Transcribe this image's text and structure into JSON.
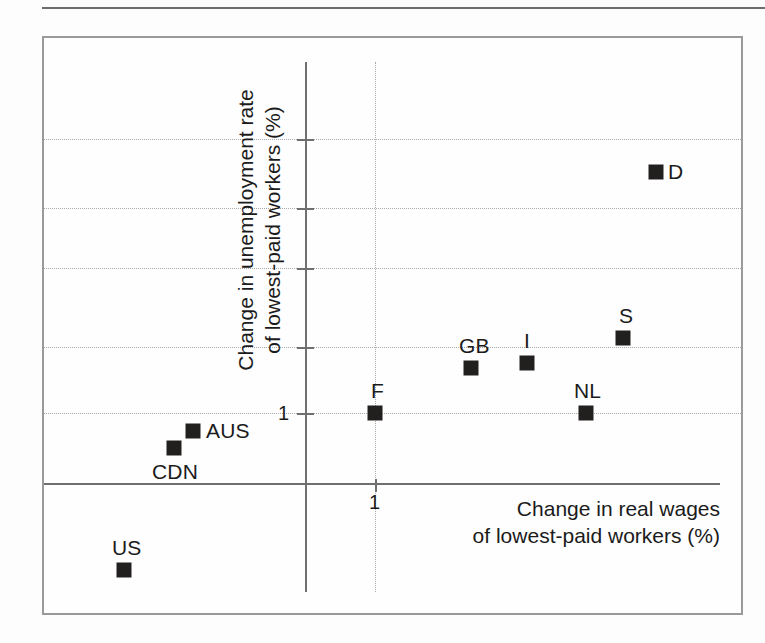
{
  "figure": {
    "background_color": "#fdfdfd",
    "frame_color": "#9a9a9a",
    "axis_color": "#6f6f6f",
    "grid_color": "#a9a9a9",
    "marker_color": "#221f1f",
    "text_color": "#1b1b1b"
  },
  "chart_data": {
    "type": "scatter",
    "title": "",
    "xlabel": "Change in real wages\nof lowest-paid workers (%)",
    "ylabel": "Change in unemployment rate\nof lowest-paid workers (%)",
    "grid": true,
    "legend": "none",
    "xtick_labels": [
      "1"
    ],
    "ytick_labels": [
      "1"
    ],
    "x_axis_note": "origin axes cross; only the value 1 is labelled on each axis",
    "y_axis_note": "five horizontal dotted gridlines, the lowest one labelled 1",
    "points": [
      {
        "label": "D",
        "x_px": 656,
        "y_px": 172,
        "label_dx": 12,
        "label_dy": -12,
        "label_align": "right-of-marker"
      },
      {
        "label": "S",
        "x_px": 623,
        "y_px": 338,
        "label_dx": -4,
        "label_dy": -34,
        "label_align": "above-marker"
      },
      {
        "label": "I",
        "x_px": 527,
        "y_px": 363,
        "label_dx": -3,
        "label_dy": -34,
        "label_align": "above-marker"
      },
      {
        "label": "GB",
        "x_px": 471,
        "y_px": 368,
        "label_dx": -12,
        "label_dy": -34,
        "label_align": "above-marker"
      },
      {
        "label": "NL",
        "x_px": 586,
        "y_px": 413,
        "label_dx": -12,
        "label_dy": -34,
        "label_align": "above-marker"
      },
      {
        "label": "F",
        "x_px": 375,
        "y_px": 413,
        "label_dx": -4,
        "label_dy": -34,
        "label_align": "above-marker"
      },
      {
        "label": "AUS",
        "x_px": 193,
        "y_px": 431,
        "label_dx": 13,
        "label_dy": -12,
        "label_align": "right-of-marker"
      },
      {
        "label": "CDN",
        "x_px": 174,
        "y_px": 448,
        "label_dx": -22,
        "label_dy": 12,
        "label_align": "below-marker"
      },
      {
        "label": "US",
        "x_px": 124,
        "y_px": 570,
        "label_dx": -12,
        "label_dy": -34,
        "label_align": "above-marker"
      }
    ],
    "gridlines_h_px": [
      139,
      208,
      268,
      347,
      413
    ],
    "gridline_v_px": [
      375
    ],
    "yticks_px": [
      139,
      208,
      268,
      347,
      413
    ],
    "xticks_px": [
      375
    ],
    "origin_axis_x_px": 306,
    "origin_axis_y_px": 483
  },
  "labels": {
    "x_title": "Change in real wages\nof lowest-paid workers (%)",
    "y_title": "Change in unemployment rate\nof lowest-paid workers (%)",
    "y_tick_one": "1",
    "x_tick_one": "1"
  }
}
